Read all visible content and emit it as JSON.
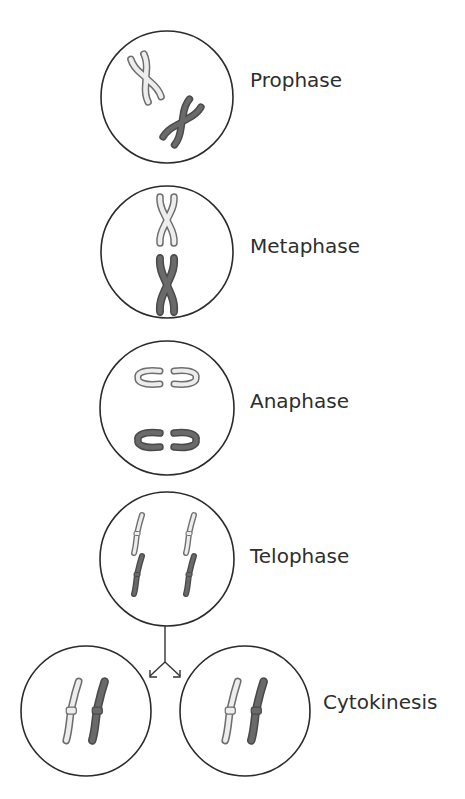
{
  "diagram": {
    "colors": {
      "background": "#ffffff",
      "cell_outline": "#2b2b2b",
      "chromosome_light_fill": "#ededed",
      "chromosome_light_outline": "#6e6e6e",
      "chromosome_dark_fill": "#6a6a6a",
      "chromosome_dark_outline": "#4a4a4a",
      "label_text": "#2e2e2e"
    },
    "stages": [
      {
        "id": "prophase",
        "label": "Prophase",
        "cells": [
          {
            "cx": 167,
            "cy": 97,
            "r": 66
          }
        ],
        "label_pos": {
          "x": 250,
          "y": 87
        },
        "chromosome_shape": "X (condensed, randomly oriented)"
      },
      {
        "id": "metaphase",
        "label": "Metaphase",
        "cells": [
          {
            "cx": 167,
            "cy": 252,
            "r": 66
          }
        ],
        "label_pos": {
          "x": 250,
          "y": 253
        },
        "chromosome_shape": "X (aligned on center line)"
      },
      {
        "id": "anaphase",
        "label": "Anaphase",
        "cells": [
          {
            "cx": 167,
            "cy": 408,
            "r": 67
          }
        ],
        "label_pos": {
          "x": 250,
          "y": 408
        },
        "chromosome_shape": "C-shaped chromatids pulled apart"
      },
      {
        "id": "telophase",
        "label": "Telophase",
        "cells": [
          {
            "cx": 167,
            "cy": 559,
            "r": 67
          }
        ],
        "label_pos": {
          "x": 250,
          "y": 563
        },
        "chromosome_shape": "single chromatids at each pole"
      },
      {
        "id": "cytokinesis",
        "label": "Cytokinesis",
        "cells": [
          {
            "cx": 86,
            "cy": 711,
            "r": 65
          },
          {
            "cx": 245,
            "cy": 711,
            "r": 65
          }
        ],
        "label_pos": {
          "x": 323,
          "y": 709
        },
        "chromosome_shape": "two daughter cells with one light and one dark chromosome"
      }
    ],
    "arrow": {
      "from": {
        "x": 165,
        "y": 626
      },
      "split": {
        "x": 165,
        "y": 661
      },
      "left_tip": {
        "x": 150,
        "y": 677
      },
      "right_tip": {
        "x": 180,
        "y": 677
      }
    }
  }
}
